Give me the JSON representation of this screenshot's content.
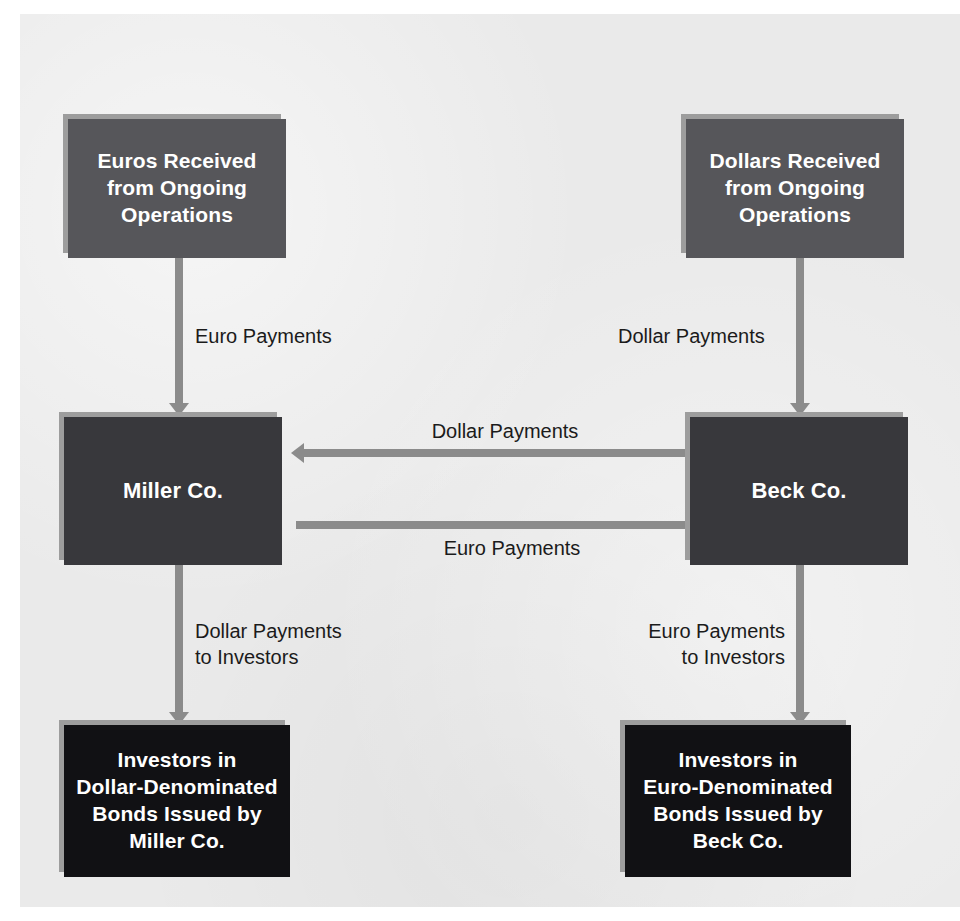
{
  "diagram": {
    "background_color": "#eaeaea",
    "connector_color": "#8b8b8b",
    "nodes": {
      "euros_received": {
        "text": "Euros Received\nfrom Ongoing\nOperations",
        "fill": "#56565a",
        "text_color": "#ffffff"
      },
      "dollars_received": {
        "text": "Dollars Received\nfrom Ongoing\nOperations",
        "fill": "#56565a",
        "text_color": "#ffffff"
      },
      "miller_co": {
        "text": "Miller Co.",
        "fill": "#38383c",
        "text_color": "#ffffff"
      },
      "beck_co": {
        "text": "Beck Co.",
        "fill": "#38383c",
        "text_color": "#ffffff"
      },
      "investors_dollar_bonds": {
        "text": "Investors in\nDollar-Denominated\nBonds Issued by\nMiller Co.",
        "fill": "#111114",
        "text_color": "#ffffff"
      },
      "investors_euro_bonds": {
        "text": "Investors in\nEuro-Denominated\nBonds Issued by\nBeck Co.",
        "fill": "#111114",
        "text_color": "#ffffff"
      }
    },
    "edges": {
      "euros_to_miller": {
        "label": "Euro Payments",
        "from": "euros_received",
        "to": "miller_co",
        "direction": "down"
      },
      "dollars_to_beck": {
        "label": "Dollar Payments",
        "from": "dollars_received",
        "to": "beck_co",
        "direction": "down"
      },
      "beck_to_miller": {
        "label": "Dollar Payments",
        "from": "beck_co",
        "to": "miller_co",
        "direction": "left"
      },
      "miller_to_beck": {
        "label": "Euro Payments",
        "from": "miller_co",
        "to": "beck_co",
        "direction": "right"
      },
      "miller_to_investors": {
        "label": "Dollar Payments\nto Investors",
        "from": "miller_co",
        "to": "investors_dollar_bonds",
        "direction": "down"
      },
      "beck_to_investors": {
        "label": "Euro Payments\nto Investors",
        "from": "beck_co",
        "to": "investors_euro_bonds",
        "direction": "down"
      }
    }
  }
}
